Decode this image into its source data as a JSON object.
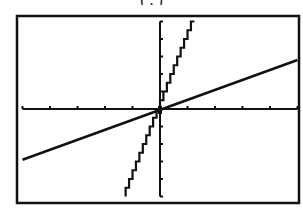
{
  "caption_fragment": "          (  ,  )",
  "chart_data": {
    "type": "line",
    "title": "",
    "xlabel": "",
    "ylabel": "",
    "xlim": [
      -5,
      5
    ],
    "ylim": [
      -5,
      5
    ],
    "xscale_tick": 1,
    "yscale_tick": 1,
    "grid": false,
    "legend": null,
    "series": [
      {
        "name": "steep line (dotted/stepped)",
        "style": "pixelated-steep",
        "slope": 4,
        "intercept": 0,
        "x": [
          -1.25,
          1.25
        ],
        "y": [
          -5,
          5
        ]
      },
      {
        "name": "shallow line (solid)",
        "style": "solid",
        "slope": 0.57,
        "intercept": 0,
        "x": [
          -5,
          5
        ],
        "y": [
          -2.9,
          2.8
        ]
      }
    ]
  },
  "layout": {
    "frame": {
      "x1": 17,
      "y1": 16,
      "x2": 299,
      "y2": 203,
      "color": "#111111"
    },
    "origin_px": {
      "x": 160,
      "y": 109
    },
    "px_per_unit_x": 27.5,
    "px_per_unit_y": 17.5,
    "axis_color": "#111111",
    "line_color": "#111111"
  }
}
